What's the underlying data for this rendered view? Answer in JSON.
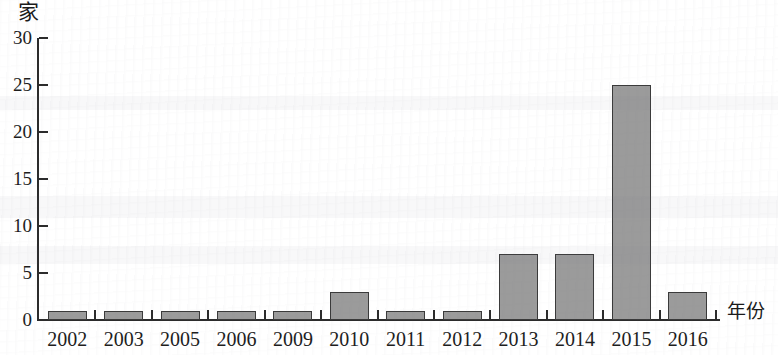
{
  "chart_data": {
    "type": "bar",
    "title": "",
    "subtitle": "",
    "xlabel": "年份",
    "ylabel": "家",
    "categories": [
      "2002",
      "2003",
      "2005",
      "2006",
      "2009",
      "2010",
      "2011",
      "2012",
      "2013",
      "2014",
      "2015",
      "2016"
    ],
    "values": [
      1,
      1,
      1,
      1,
      1,
      3,
      1,
      1,
      7,
      7,
      25,
      3
    ],
    "series": [
      {
        "name": "",
        "values": [
          1,
          1,
          1,
          1,
          1,
          3,
          1,
          1,
          7,
          7,
          25,
          3
        ]
      }
    ],
    "ylim": [
      0,
      30
    ],
    "yticks": [
      0,
      5,
      10,
      15,
      20,
      25,
      30
    ],
    "ytick_labels": [
      "0",
      "5",
      "10",
      "15",
      "20",
      "25",
      "30"
    ],
    "grid": false,
    "legend": null,
    "legend_position": "none",
    "bar_fill_color": "#9b9b9b",
    "bar_border_color": "#3a3a3a",
    "axis_color": "#2b2b2b",
    "background_color": "#ffffff"
  },
  "axes": {
    "unit_label": "家",
    "x_axis_title": "年份"
  }
}
